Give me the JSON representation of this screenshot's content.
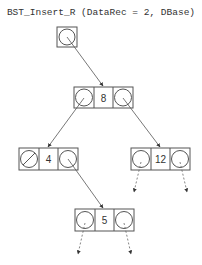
{
  "title": "BST_Insert_R (DataRec = 2, DBase)",
  "nodes": [
    {
      "id": "n8",
      "key": "8"
    },
    {
      "id": "n4",
      "key": "4"
    },
    {
      "id": "n12",
      "key": "12"
    },
    {
      "id": "n5",
      "key": "5"
    }
  ],
  "colors": {
    "line": "#555555",
    "dashed": "#666666",
    "background": "#ffffff"
  }
}
